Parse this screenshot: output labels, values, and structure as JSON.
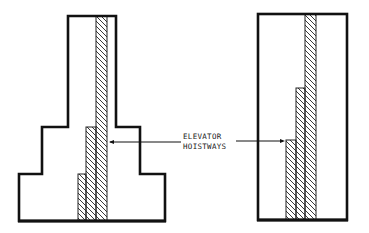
{
  "diagram": {
    "label_line1": "ELEVATOR",
    "label_line2": "HOISTWAYS",
    "line_color": "#111111",
    "background": "#ffffff",
    "left_building": {
      "description": "Stepped (setback) tower with three tiers",
      "tiers": 3,
      "hoistway_groups": 3
    },
    "right_building": {
      "description": "Rectangular slab tower",
      "hoistway_groups": 3
    }
  }
}
